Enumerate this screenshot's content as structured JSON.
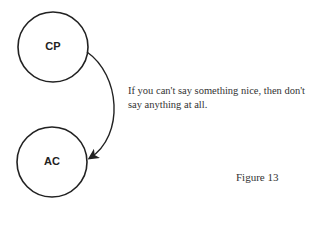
{
  "diagram": {
    "nodes": [
      {
        "id": "cp",
        "label": "CP"
      },
      {
        "id": "ac",
        "label": "AC"
      }
    ],
    "edges": [
      {
        "from": "CP",
        "to": "AC",
        "type": "curved-arrow"
      }
    ],
    "annotation": "If you can't say something nice, then don't say anything at all.",
    "caption": "Figure 13"
  }
}
